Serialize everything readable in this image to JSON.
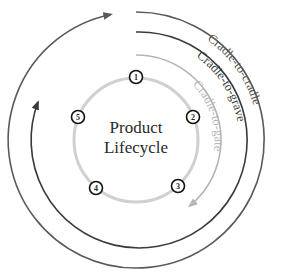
{
  "diagram": {
    "center_label": {
      "line1": "Product",
      "line2": "Lifecycle"
    },
    "stages": [
      {
        "label": "1"
      },
      {
        "label": "2"
      },
      {
        "label": "3"
      },
      {
        "label": "4"
      },
      {
        "label": "5"
      }
    ],
    "scopes": {
      "gate": {
        "label": "Cradle-to-gate",
        "color": "#b5b5b5"
      },
      "grave": {
        "label": "Cradle-to-grave",
        "color": "#3a3a3a"
      },
      "cradle": {
        "label": "Cradle-to-cradle",
        "color": "#5a5a5a"
      }
    },
    "inner_ring_color": "#d0d0d0"
  }
}
